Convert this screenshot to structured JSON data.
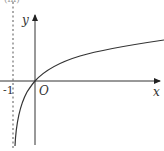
{
  "figure": {
    "part_label": "(iii)",
    "axes": {
      "x_label": "x",
      "y_label": "y",
      "origin_label": "O"
    },
    "asymptote": {
      "label": "-1",
      "x_value": -1,
      "style": "dashed"
    },
    "curve": {
      "description": "y = ln(x + 1)",
      "passes_through": [
        0,
        0
      ],
      "vertical_asymptote": -1
    },
    "colors": {
      "line": "#333333",
      "asymptote": "#888888"
    }
  }
}
